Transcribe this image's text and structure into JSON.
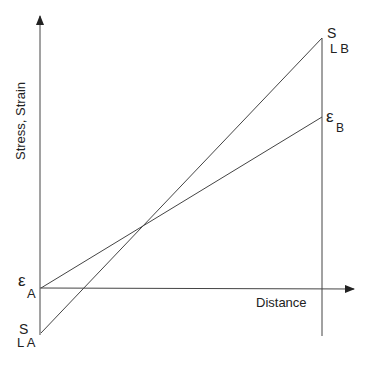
{
  "diagram": {
    "axes": {
      "y_label": "Stress, Strain",
      "x_label": "Distance"
    },
    "labels": {
      "eps_a_symbol": "ε",
      "eps_a_sub": "A",
      "eps_b_symbol": "ε",
      "eps_b_sub": "B",
      "s_la_symbol": "S",
      "s_la_sub": "L A",
      "s_lb_symbol": "S",
      "s_lb_sub": "L B"
    },
    "lines": [
      {
        "name": "stress-line",
        "from": "S_LA",
        "to": "S_LB"
      },
      {
        "name": "strain-line",
        "from": "ε_A",
        "to": "ε_B"
      }
    ],
    "colors": {
      "line": "#444444",
      "text": "#222222"
    }
  }
}
